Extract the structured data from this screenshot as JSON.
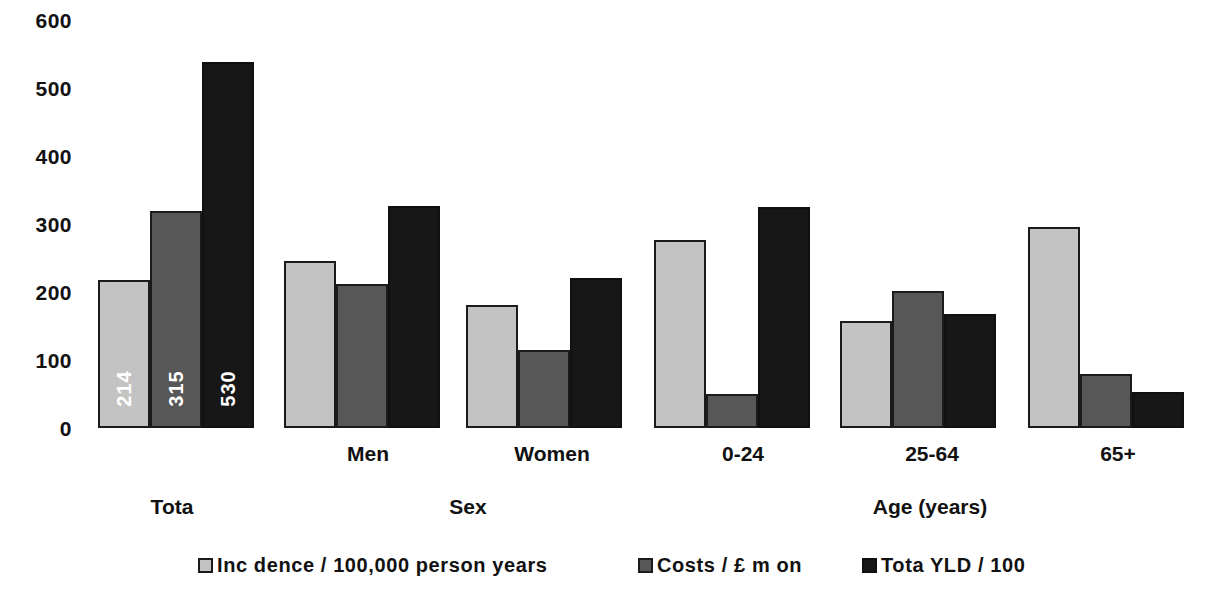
{
  "chart_data": {
    "type": "bar",
    "title": "",
    "xlabel": "",
    "ylabel": "",
    "ylim": [
      0,
      600
    ],
    "yticks": [
      0,
      100,
      200,
      300,
      400,
      500,
      600
    ],
    "ytick_labels": [
      "0",
      "100",
      "200",
      "300",
      "400",
      "500",
      "600"
    ],
    "grid": false,
    "legend_position": "bottom",
    "categories": [
      "",
      "Men",
      "Women",
      "0-24",
      "25-64",
      "65+"
    ],
    "group_labels": [
      "Tota",
      "Sex",
      "Age (years)"
    ],
    "series": [
      {
        "name": "Inc dence / 100,000 person years",
        "color": "#c3c3c3",
        "values": [
          214,
          242,
          178,
          272,
          155,
          292
        ],
        "data_labels": [
          "214",
          "",
          "",
          "",
          "",
          ""
        ]
      },
      {
        "name": "Costs / £ m  on",
        "color": "#575757",
        "values": [
          315,
          208,
          113,
          50,
          198,
          78
        ],
        "data_labels": [
          "315",
          "",
          "",
          "",
          "",
          ""
        ]
      },
      {
        "name": "Tota YLD / 100",
        "color": "#171717",
        "values": [
          530,
          322,
          218,
          320,
          165,
          52
        ],
        "data_labels": [
          "530",
          "",
          "",
          "",
          "",
          ""
        ]
      }
    ]
  },
  "axis": {
    "y_labels": [
      "600",
      "500",
      "400",
      "300",
      "200",
      "100",
      "0"
    ]
  },
  "categories": [
    {
      "label": ""
    },
    {
      "label": "Men"
    },
    {
      "label": "Women"
    },
    {
      "label": "0-24"
    },
    {
      "label": "25-64"
    },
    {
      "label": "65+"
    }
  ],
  "groups": [
    {
      "label": "Tota"
    },
    {
      "label": "Sex"
    },
    {
      "label": "Age (years)"
    }
  ],
  "legend": [
    {
      "label": "Inc dence / 100,000 person years"
    },
    {
      "label": "Costs / £ m  on"
    },
    {
      "label": "Tota YLD / 100"
    }
  ]
}
